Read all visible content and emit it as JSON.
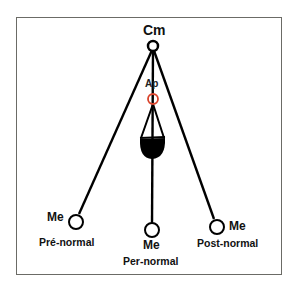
{
  "diagram": {
    "type": "cephalometric-pendulum",
    "colors": {
      "line": "#000000",
      "ap_point": "#d9432b",
      "frame": "#6b6b66",
      "background": "#ffffff"
    },
    "points": {
      "cm": {
        "label": "Cm"
      },
      "ap": {
        "label": "Ap"
      },
      "me_pre": {
        "label": "Me"
      },
      "me_per": {
        "label": "Me"
      },
      "me_post": {
        "label": "Me"
      }
    },
    "categories": {
      "pre": "Pré-normal",
      "per": "Per-normal",
      "post": "Post-normal"
    }
  }
}
